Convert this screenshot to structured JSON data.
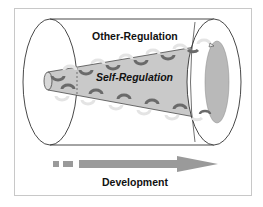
{
  "diagram": {
    "outer_label": "Other-Regulation",
    "inner_label": "Self-Regulation",
    "axis_label": "Development",
    "colors": {
      "cone_fill": "#c9c9c9",
      "cone_end_fill": "#b9b9b9",
      "arrow_fill": "#9a9a9a",
      "outline": "#333333",
      "frame_border": "#c8c8c8",
      "spiral_dark": "#6a6a6a",
      "spiral_light": "#e4e4e4"
    },
    "structure": {
      "outer": "cylinder",
      "inner": "expanding cone",
      "spiral_arrows": "circular arrows wrapping inner cone (top and bottom rows)"
    }
  }
}
